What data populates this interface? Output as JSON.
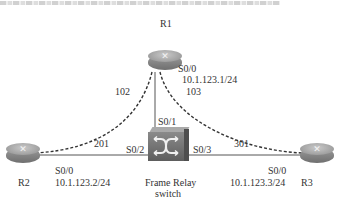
{
  "routers": [
    {
      "id": "R1",
      "label": "R1",
      "interface": "S0/0",
      "ip": "10.1.123.1/24"
    },
    {
      "id": "R2",
      "label": "R2",
      "interface": "S0/0",
      "ip": "10.1.123.2/24"
    },
    {
      "id": "R3",
      "label": "R3",
      "interface": "S0/0",
      "ip": "10.1.123.3/24"
    }
  ],
  "switch": {
    "label_line1": "Frame Relay",
    "label_line2": "switch",
    "ports": {
      "r1": "S0/1",
      "r2": "S0/2",
      "r3": "S0/3"
    }
  },
  "dlci": {
    "r1_to_r2": "102",
    "r1_to_r3": "103",
    "r2_to_r1": "201",
    "r3_to_r1": "301"
  }
}
